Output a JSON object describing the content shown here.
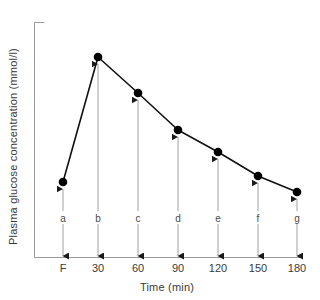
{
  "chart_data": {
    "type": "line",
    "title": "",
    "xlabel": "Time (min)",
    "ylabel": "Plasma glucose concentration (mmol/l)",
    "x_tick_labels": [
      "F",
      "30",
      "60",
      "90",
      "120",
      "150",
      "180"
    ],
    "point_labels": [
      "a",
      "b",
      "c",
      "d",
      "e",
      "f",
      "g"
    ],
    "categories": [
      "F",
      "30",
      "60",
      "90",
      "120",
      "150",
      "180"
    ],
    "values": [
      4.4,
      10.0,
      8.4,
      6.8,
      5.8,
      4.8,
      4.2
    ],
    "axis_ranges": {
      "x_pixel_min": 34,
      "x_pixel_max": 300,
      "y_pixel_min": 22,
      "y_pixel_max": 257
    },
    "grid": false,
    "legend": "none",
    "marker": "filled-circle",
    "annotation_style": "double-headed-vertical-arrow",
    "points": [
      {
        "label": "a",
        "tick": "F",
        "px": 63,
        "py": 182
      },
      {
        "label": "b",
        "tick": "30",
        "px": 98,
        "py": 57
      },
      {
        "label": "c",
        "tick": "60",
        "px": 138,
        "py": 93
      },
      {
        "label": "d",
        "tick": "90",
        "px": 178,
        "py": 130
      },
      {
        "label": "e",
        "tick": "120",
        "px": 218,
        "py": 152
      },
      {
        "label": "f",
        "tick": "150",
        "px": 258,
        "py": 176
      },
      {
        "label": "g",
        "tick": "180",
        "px": 297,
        "py": 192
      }
    ],
    "colors": {
      "axis": "#999999",
      "line": "#111111",
      "marker": "#000000",
      "arrow": "#a0a0a0",
      "text": "#3a3a3a"
    }
  },
  "labels": {
    "y_axis_title": "Plasma glucose concentration (mmol/l)",
    "x_axis_title": "Time (min)"
  }
}
